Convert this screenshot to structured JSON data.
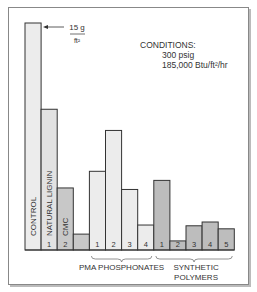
{
  "chart_data": {
    "type": "bar",
    "title": "",
    "xlabel": "",
    "ylabel": "",
    "ylim": [
      0,
      15
    ],
    "grid": false,
    "annotation_top": {
      "value": "15 g",
      "denominator": "ft²",
      "points_to": "CONTROL"
    },
    "conditions": {
      "heading": "CONDITIONS:",
      "pressure": "300  psig",
      "heat_flux": "185,000  Btu/ft²/hr"
    },
    "categories": [
      "CONTROL",
      "NATURAL LIGNIN 1",
      "CMC 2",
      "",
      "PMA 1",
      "PMA 2",
      "PMA 3",
      "PMA 4",
      "SYN 1",
      "SYN 2",
      "SYN 3",
      "SYN 4",
      "SYN 5"
    ],
    "bars": [
      {
        "label": "CONTROL",
        "num": "",
        "value": 15.0,
        "group": "control",
        "fill": "#ececec"
      },
      {
        "label": "NATURAL LIGNIN",
        "num": "1",
        "value": 9.3,
        "group": "natural",
        "fill": "#e2e2e2"
      },
      {
        "label": "CMC",
        "num": "2",
        "value": 4.1,
        "group": "natural",
        "fill": "#c8c8c8"
      },
      {
        "label": "",
        "num": "",
        "value": 1.05,
        "group": "blank",
        "fill": "#c8c8c8"
      },
      {
        "label": "",
        "num": "1",
        "value": 5.2,
        "group": "pma",
        "fill": "#ececec"
      },
      {
        "label": "",
        "num": "2",
        "value": 7.9,
        "group": "pma",
        "fill": "#ececec"
      },
      {
        "label": "",
        "num": "3",
        "value": 4.0,
        "group": "pma",
        "fill": "#ececec"
      },
      {
        "label": "",
        "num": "4",
        "value": 1.65,
        "group": "pma",
        "fill": "#ececec"
      },
      {
        "label": "",
        "num": "1",
        "value": 4.6,
        "group": "synthetic",
        "fill": "#bdbdbd"
      },
      {
        "label": "",
        "num": "2",
        "value": 0.6,
        "group": "synthetic",
        "fill": "#bdbdbd"
      },
      {
        "label": "",
        "num": "3",
        "value": 1.6,
        "group": "synthetic",
        "fill": "#bdbdbd"
      },
      {
        "label": "",
        "num": "4",
        "value": 1.85,
        "group": "synthetic",
        "fill": "#bdbdbd"
      },
      {
        "label": "",
        "num": "5",
        "value": 1.4,
        "group": "synthetic",
        "fill": "#bdbdbd"
      }
    ],
    "group_labels": [
      {
        "text": "PMA PHOSPHONATES",
        "from": 4,
        "to": 7
      },
      {
        "text": "SYNTHETIC POLYMERS",
        "from": 8,
        "to": 12
      }
    ]
  }
}
